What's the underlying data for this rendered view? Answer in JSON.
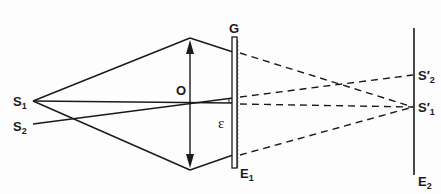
{
  "diagram": {
    "type": "optics-ray-diagram",
    "colors": {
      "ink": "#1a1a1a",
      "background": "#fdfdfd"
    },
    "labels": {
      "source1": "S",
      "source1_sub": "1",
      "source2": "S",
      "source2_sub": "2",
      "lens": "O",
      "grating": "G",
      "angle": "ε",
      "plane1": "E",
      "plane1_sub": "1",
      "image1": "S′",
      "image1_sub": "1",
      "image2": "S′",
      "image2_sub": "2",
      "screen": "E",
      "screen_sub": "2"
    },
    "points": {
      "S1": [
        33,
        101
      ],
      "S2": [
        33,
        124
      ],
      "lens_top": [
        190,
        38
      ],
      "lens_bottom": [
        190,
        170
      ],
      "grating_x": 234,
      "screen_x": 414,
      "S1_prime": [
        414,
        107
      ],
      "S2_prime": [
        414,
        75
      ]
    }
  }
}
